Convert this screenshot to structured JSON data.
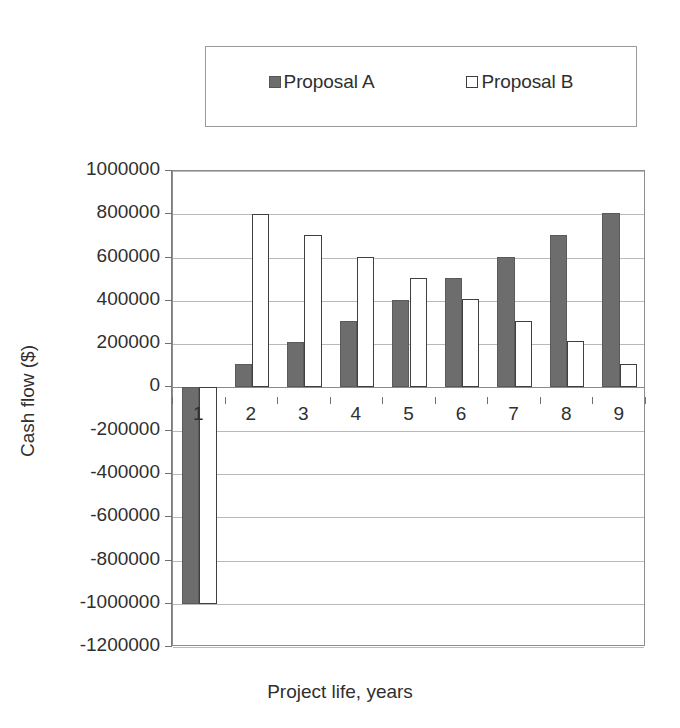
{
  "legend": {
    "entries": [
      {
        "label": "Proposal A",
        "marker": "filled-square-marker",
        "color": "#6d6d6d"
      },
      {
        "label": "Proposal B",
        "marker": "hollow-square-marker",
        "color": "#ffffff"
      }
    ]
  },
  "chart_data": {
    "type": "bar",
    "title": "",
    "xlabel": "Project life, years",
    "ylabel": "Cash flow ($)",
    "categories": [
      "1",
      "2",
      "3",
      "4",
      "5",
      "6",
      "7",
      "8",
      "9"
    ],
    "series": [
      {
        "name": "Proposal A",
        "color": "#6d6d6d",
        "values": [
          -1000000,
          110000,
          210000,
          305000,
          405000,
          505000,
          605000,
          705000,
          805000
        ]
      },
      {
        "name": "Proposal B",
        "color": "#ffffff",
        "values": [
          -1000000,
          800000,
          705000,
          605000,
          505000,
          410000,
          305000,
          215000,
          110000
        ]
      }
    ],
    "ylim": [
      -1200000,
      1000000
    ],
    "ytick_step": 200000,
    "yticks": [
      1000000,
      800000,
      600000,
      400000,
      200000,
      0,
      -200000,
      -400000,
      -600000,
      -800000,
      -1000000,
      -1200000
    ],
    "ytick_labels": [
      "1000000",
      "800000",
      "600000",
      "400000",
      "200000",
      "0",
      "-200000",
      "-400000",
      "-600000",
      "-800000",
      "-1000000",
      "-1200000"
    ],
    "grid": true,
    "legend_position": "top"
  }
}
